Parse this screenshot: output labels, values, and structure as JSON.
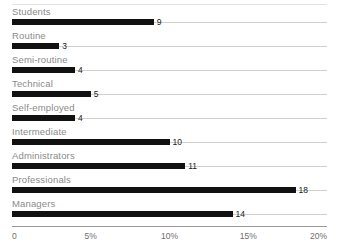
{
  "chart_data": {
    "type": "bar",
    "orientation": "horizontal",
    "title": "",
    "subtitle": "",
    "xlabel": "",
    "ylabel": "",
    "categories": [
      "Students",
      "Routine",
      "Semi-routine",
      "Technical",
      "Self-employed",
      "Intermediate",
      "Administrators",
      "Professionals",
      "Managers"
    ],
    "values": [
      9,
      3,
      4,
      5,
      4,
      10,
      11,
      18,
      14
    ],
    "value_labels": [
      "9",
      "3",
      "4",
      "5",
      "4",
      "10",
      "11",
      "18",
      "14"
    ],
    "xlim": [
      0,
      20
    ],
    "xticks": [
      0,
      5,
      10,
      15,
      20
    ],
    "xtick_labels": [
      "0",
      "5%",
      "10%",
      "15%",
      "20%"
    ],
    "grid": true,
    "legend": false,
    "legend_position": "none",
    "unit": "%",
    "bar_color": "#111111",
    "grid_color": "#cfcfcf",
    "axis_color": "#9a9a9a",
    "label_color": "#8a8a8a",
    "value_color": "#1a1a1a",
    "background_color": "#ffffff"
  }
}
